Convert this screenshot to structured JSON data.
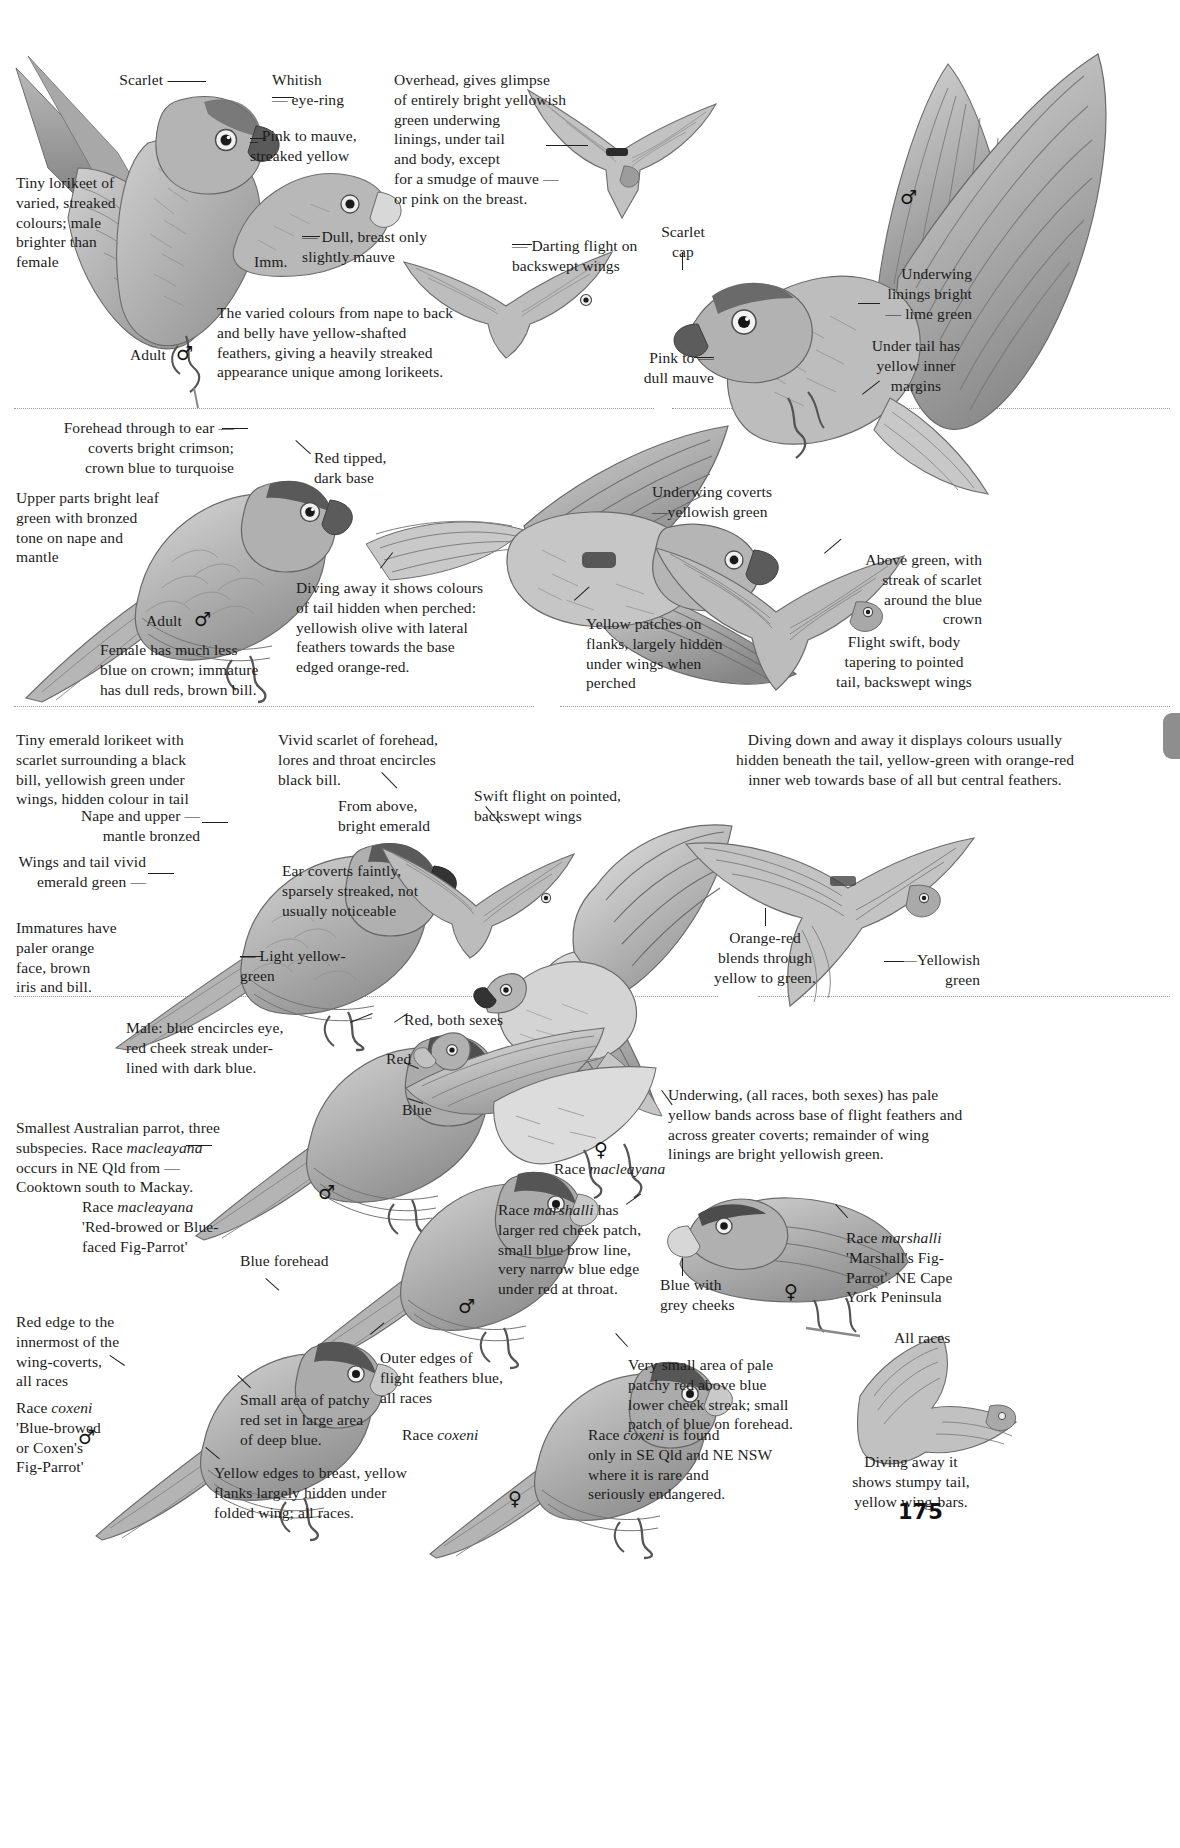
{
  "page": {
    "number": "175",
    "folio_name": "page-number"
  },
  "panels": [
    {
      "id": "little-lorikeet",
      "labels": [
        {
          "name": "label-scarlet",
          "text": "Scarlet —"
        },
        {
          "name": "label-whitish-eye-ring",
          "text": "Whitish\n— eye-ring"
        },
        {
          "name": "label-pink-to-mauve",
          "text": "_ Pink to mauve,\n   streaked yellow"
        },
        {
          "name": "label-tiny-lorikeet",
          "text": "Tiny lorikeet of\nvaried, streaked\ncolours; male\nbrighter than\nfemale"
        },
        {
          "name": "label-dull-breast",
          "text": "— Dull, breast only\n    slightly mauve"
        },
        {
          "name": "label-imm",
          "text": "Imm."
        },
        {
          "name": "label-adult-male",
          "text": "Adult"
        },
        {
          "name": "label-varied-colours",
          "text": "The varied colours from nape to back\nand belly have yellow-shafted\nfeathers, giving a heavily streaked\nappearance unique among lorikeets."
        },
        {
          "name": "label-overhead-glimpse",
          "text": "Overhead, gives glimpse\nof entirely bright yellowish\ngreen underwing\nlinings, under tail\nand body, except\nfor a smudge of mauve —\nor pink on the breast."
        },
        {
          "name": "label-darting-flight",
          "text": "— Darting flight on\n    backswept wings"
        },
        {
          "name": "label-scarlet-cap",
          "text": "Scarlet\ncap"
        },
        {
          "name": "label-pink-to-dull-mauve",
          "text": "Pink to —\ndull mauve"
        },
        {
          "name": "label-underwing-linings",
          "text": "Underwing\nlinings bright\n— lime green"
        },
        {
          "name": "label-under-tail-yellow",
          "text": "Under tail has\nyellow inner\nmargins"
        }
      ]
    },
    {
      "id": "red-flanked-lorikeet",
      "labels": [
        {
          "name": "label-forehead-crimson",
          "text": "Forehead through to ear —\ncoverts bright crimson;\ncrown blue to turquoise"
        },
        {
          "name": "label-red-tipped",
          "text": "Red tipped,\ndark base"
        },
        {
          "name": "label-upper-parts-leaf-green",
          "text": "Upper parts bright leaf\ngreen with bronzed\ntone on nape and\nmantle"
        },
        {
          "name": "label-adult-male-2",
          "text": "Adult"
        },
        {
          "name": "label-female-less-blue",
          "text": "Female has much less\nblue on crown; immature\nhas dull reds, brown bill."
        },
        {
          "name": "label-diving-away",
          "text": "Diving away it shows colours\nof tail hidden when perched:\nyellowish olive with lateral\nfeathers towards the base\nedged orange-red."
        },
        {
          "name": "label-underwing-coverts",
          "text": "Underwing coverts\n—yellowish green"
        },
        {
          "name": "label-yellow-patches-flanks",
          "text": "Yellow patches on\nflanks, largely hidden\nunder wings when\nperched"
        },
        {
          "name": "label-above-green-scarlet",
          "text": "Above green, with\nstreak of scarlet\naround the blue\ncrown"
        },
        {
          "name": "label-flight-swift",
          "text": "Flight swift, body\ntapering to pointed\ntail, backswept wings"
        }
      ]
    },
    {
      "id": "emerald-lorikeet",
      "labels": [
        {
          "name": "label-tiny-emerald-lorikeet",
          "text": "Tiny emerald lorikeet with\nscarlet surrounding a black\nbill, yellowish green under\nwings, hidden colour in tail"
        },
        {
          "name": "label-vivid-scarlet",
          "text": "Vivid scarlet of forehead,\nlores and throat encircles\nblack bill."
        },
        {
          "name": "label-diving-down-away",
          "text": "Diving down and away it displays colours usually\nhidden beneath the tail, yellow-green with orange-red\ninner web towards base of all but central feathers."
        },
        {
          "name": "label-nape-mantle-bronzed",
          "text": "Nape and upper —\nmantle bronzed"
        },
        {
          "name": "label-from-above-emerald",
          "text": "From above,\nbright emerald"
        },
        {
          "name": "label-swift-flight-pointed",
          "text": "Swift flight on pointed,\nbackswept wings"
        },
        {
          "name": "label-wings-tail-emerald",
          "text": "Wings and tail vivid\nemerald green —"
        },
        {
          "name": "label-ear-coverts-faintly",
          "text": "Ear coverts faintly,\nsparsely streaked, not\nusually noticeable"
        },
        {
          "name": "label-immatures-paler",
          "text": "Immatures have\npaler orange\nface, brown\niris and bill."
        },
        {
          "name": "label-light-yellow-green",
          "text": "— Light yellow-\n   green"
        },
        {
          "name": "label-orange-red-blends",
          "text": "Orange-red\nblends through\nyellow to green."
        },
        {
          "name": "label-yellowish-green",
          "text": "—Yellowish\ngreen"
        }
      ]
    },
    {
      "id": "double-eyed-fig-parrot",
      "labels": [
        {
          "name": "label-male-blue-encircles",
          "text": "Male: blue encircles eye,\nred cheek streak under-\nlined with dark blue."
        },
        {
          "name": "label-red-both-sexes",
          "text": "Red, both sexes"
        },
        {
          "name": "label-red",
          "text": "Red"
        },
        {
          "name": "label-blue",
          "text": "Blue"
        },
        {
          "name": "label-smallest-australian-parrot",
          "text": "Smallest Australian parrot, three\nsubspecies.  Race macleayana\noccurs in NE Qld from      —\nCooktown south to Mackay."
        },
        {
          "name": "label-race-macleayana-caption",
          "text": "Race macleayana"
        },
        {
          "name": "label-underwing-all-races",
          "text": "Underwing, (all races, both sexes) has pale\nyellow bands across base of flight feathers and\nacross greater coverts; remainder of wing\nlinings are bright yellowish green."
        },
        {
          "name": "label-race-macleayana-name",
          "text": "Race macleayana\n'Red-browed or Blue-\nfaced Fig-Parrot'"
        },
        {
          "name": "label-race-marshalli-desc",
          "text": "Race marshalli has\nlarger red cheek patch,\nsmall blue brow line,\nvery narrow blue edge\nunder red at throat."
        },
        {
          "name": "label-race-marshalli-name",
          "text": "Race marshalli\n'Marshall's Fig-\nParrot'. NE Cape\nYork Peninsula"
        },
        {
          "name": "label-blue-with-grey-cheeks",
          "text": "Blue with\ngrey cheeks"
        },
        {
          "name": "label-blue-forehead",
          "text": "Blue forehead"
        },
        {
          "name": "label-red-edge-innermost",
          "text": "Red edge to the\ninnermost of the\nwing-coverts,\nall races"
        },
        {
          "name": "label-race-coxeni-name",
          "text": "Race coxeni\n'Blue-browed\nor Coxen's\nFig-Parrot'"
        },
        {
          "name": "label-small-area-patchy-red",
          "text": "Small area of patchy\nred set in large area\nof deep blue."
        },
        {
          "name": "label-outer-edges-blue",
          "text": "Outer edges of\nflight feathers blue,\nall races"
        },
        {
          "name": "label-yellow-edges-breast",
          "text": "Yellow edges to breast, yellow\nflanks largely hidden under\nfolded wing; all races."
        },
        {
          "name": "label-race-coxeni-caption",
          "text": "Race coxeni"
        },
        {
          "name": "label-very-small-area-pale",
          "text": "Very small area of pale\npatchy red above blue\nlower cheek streak; small\npatch of blue on forehead."
        },
        {
          "name": "label-race-coxeni-found",
          "text": "Race coxeni is found\nonly in SE Qld and NE NSW\nwhere it is rare and\nseriously endangered."
        },
        {
          "name": "label-all-races",
          "text": "All races"
        },
        {
          "name": "label-diving-away-stumpy",
          "text": "Diving away it\nshows stumpy tail,\nyellow wing-bars."
        }
      ]
    }
  ],
  "symbols": {
    "male": "♂",
    "female": "♀"
  },
  "colors": {
    "ink": "#1c1c1c",
    "separator": "#9a9a9a",
    "tab": "#8e8e8e"
  }
}
